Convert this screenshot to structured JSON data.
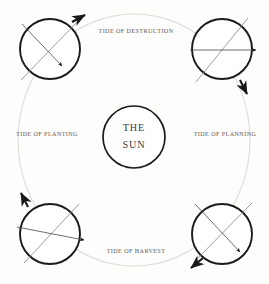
{
  "diagram": {
    "background_color": "#fdfdfc",
    "stroke_color": "#1b1b1b",
    "orbit_color": "#dedad6",
    "label_color": "#5d5a57",
    "axis_color": "#8e8a86"
  },
  "center": {
    "name": "sun",
    "line1": "THE",
    "line2": "SUN",
    "cx": 134,
    "cy": 137,
    "r": 31
  },
  "orbit": {
    "cx": 134,
    "cy": 140,
    "rx": 116,
    "ry": 126,
    "style": "faint-solid"
  },
  "labels": [
    {
      "id": "label-top",
      "text": "TIDE OF DESTRUCTION",
      "x": 136,
      "y": 32
    },
    {
      "id": "label-left",
      "text": "TIDE OF PLANTING",
      "x": 47,
      "y": 135
    },
    {
      "id": "label-right",
      "text": "TIDE OF PLANNING",
      "x": 225,
      "y": 135
    },
    {
      "id": "label-bottom",
      "text": "TIDE OF HARVEST",
      "x": 136,
      "y": 252
    }
  ],
  "planets": [
    {
      "id": "planet-top-left",
      "position": "top-left",
      "cx": 50,
      "cy": 49,
      "r": 30,
      "axis": {
        "x1": 21,
        "y1": 80,
        "x2": 80,
        "y2": 19
      },
      "ray": {
        "x1": 22,
        "y1": 24,
        "x2": 62,
        "y2": 66
      },
      "orbit_arrow": {
        "x1": 72,
        "y1": 22,
        "x2": 85,
        "y2": 15,
        "direction": "up-right"
      }
    },
    {
      "id": "planet-top-right",
      "position": "top-right",
      "cx": 222,
      "cy": 49,
      "r": 30,
      "axis": {
        "x1": 248,
        "y1": 18,
        "x2": 196,
        "y2": 82
      },
      "ray": {
        "x1": 190,
        "y1": 50,
        "x2": 256,
        "y2": 50
      },
      "orbit_arrow": {
        "x1": 240,
        "y1": 80,
        "x2": 247,
        "y2": 94,
        "direction": "down-right"
      }
    },
    {
      "id": "planet-bottom-left",
      "position": "bottom-left",
      "cx": 50,
      "cy": 234,
      "r": 30,
      "axis": {
        "x1": 24,
        "y1": 263,
        "x2": 79,
        "y2": 204
      },
      "ray": {
        "x1": 17,
        "y1": 227,
        "x2": 84,
        "y2": 240
      },
      "orbit_arrow": {
        "x1": 28,
        "y1": 207,
        "x2": 21,
        "y2": 193,
        "direction": "up-left"
      }
    },
    {
      "id": "planet-bottom-right",
      "position": "bottom-right",
      "cx": 222,
      "cy": 234,
      "r": 30,
      "axis": {
        "x1": 194,
        "y1": 262,
        "x2": 252,
        "y2": 203
      },
      "ray": {
        "x1": 195,
        "y1": 204,
        "x2": 240,
        "y2": 252
      },
      "orbit_arrow": {
        "x1": 203,
        "y1": 258,
        "x2": 191,
        "y2": 268,
        "direction": "down-left"
      }
    }
  ]
}
